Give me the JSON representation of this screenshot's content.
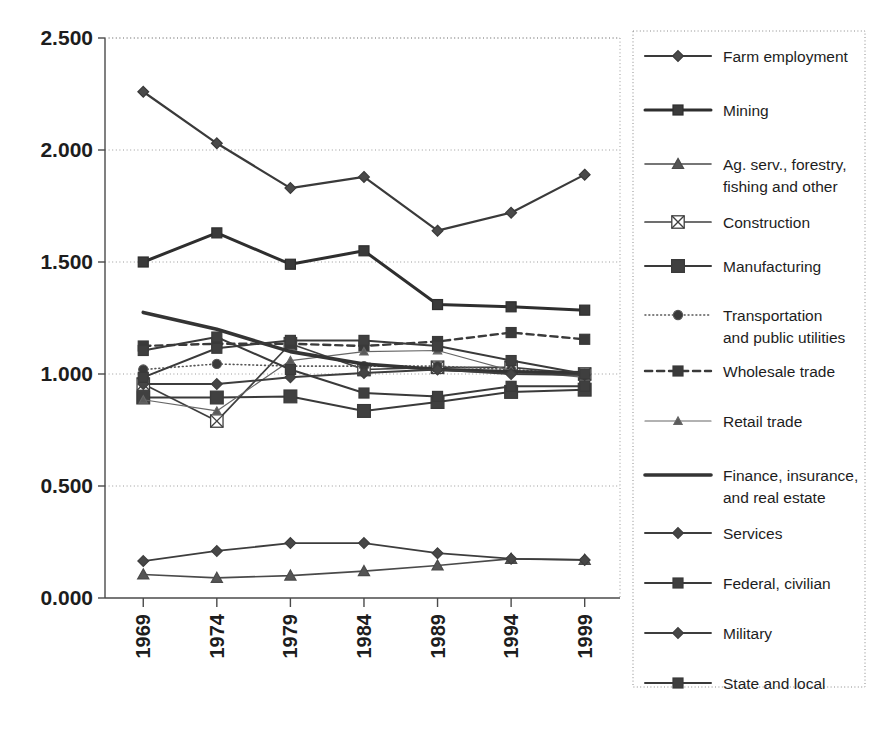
{
  "chart_data": {
    "type": "line",
    "title": "",
    "subtitle": "",
    "xlabel": "",
    "ylabel": "",
    "x": [
      1969,
      1974,
      1979,
      1984,
      1989,
      1994,
      1999
    ],
    "xtick_labels": [
      "1969",
      "1974",
      "1979",
      "1984",
      "1989",
      "1994",
      "1999"
    ],
    "ytick_labels": [
      "0.000",
      "0.500",
      "1.000",
      "1.500",
      "2.000",
      "2.500"
    ],
    "ytick_values": [
      0.0,
      0.5,
      1.0,
      1.5,
      2.0,
      2.5
    ],
    "ylim": [
      0.0,
      2.5
    ],
    "grid": "horizontal-dotted",
    "legend_position": "right",
    "series": [
      {
        "name": "Farm employment",
        "marker": "diamond",
        "line": "solid",
        "width": 2.2,
        "color": "#3a3a3a",
        "fill": "#4a4a4a",
        "values": [
          2.26,
          2.03,
          1.83,
          1.88,
          1.64,
          1.72,
          1.89
        ]
      },
      {
        "name": "Mining",
        "marker": "square",
        "line": "solid",
        "width": 3.0,
        "color": "#2e2e2e",
        "fill": "#3a3a3a",
        "values": [
          1.5,
          1.63,
          1.49,
          1.55,
          1.31,
          1.3,
          1.285
        ]
      },
      {
        "name": "Ag. serv., forestry, fishing and other",
        "marker": "triangle",
        "line": "solid",
        "width": 1.6,
        "color": "#4a4a4a",
        "fill": "#555555",
        "values": [
          0.105,
          0.09,
          0.1,
          0.12,
          0.145,
          0.175,
          0.17
        ]
      },
      {
        "name": "Construction",
        "marker": "x-box",
        "line": "solid",
        "width": 1.7,
        "color": "#3f3f3f",
        "fill": "#ffffff",
        "values": [
          0.955,
          0.79,
          1.135,
          1.02,
          1.03,
          1.03,
          1.0
        ]
      },
      {
        "name": "Manufacturing",
        "marker": "square-lg",
        "line": "solid",
        "width": 2.0,
        "color": "#3a3a3a",
        "fill": "#404040",
        "values": [
          0.895,
          0.895,
          0.9,
          0.835,
          0.875,
          0.92,
          0.93
        ]
      },
      {
        "name": "Transportation and public utilities",
        "marker": "circle",
        "line": "dotted",
        "width": 1.6,
        "color": "#555555",
        "fill": "#3a3a3a",
        "values": [
          1.02,
          1.045,
          1.035,
          1.035,
          1.035,
          1.02,
          1.0
        ]
      },
      {
        "name": "Wholesale trade",
        "marker": "square",
        "line": "dashed",
        "width": 2.4,
        "color": "#3a3a3a",
        "fill": "#3a3a3a",
        "values": [
          1.125,
          1.135,
          1.135,
          1.125,
          1.145,
          1.185,
          1.155
        ]
      },
      {
        "name": "Retail trade",
        "marker": "triangle-sm",
        "line": "solid",
        "width": 1.2,
        "color": "#666666",
        "fill": "#5a5a5a",
        "values": [
          0.885,
          0.835,
          1.06,
          1.1,
          1.105,
          1.015,
          0.985
        ]
      },
      {
        "name": "Finance, insurance, and real estate",
        "marker": "none",
        "line": "solid",
        "width": 3.6,
        "color": "#343434",
        "fill": "#343434",
        "values": [
          1.275,
          1.2,
          1.1,
          1.045,
          1.02,
          1.01,
          1.005
        ]
      },
      {
        "name": "Services",
        "marker": "diamond",
        "line": "solid",
        "width": 2.0,
        "color": "#3d3d3d",
        "fill": "#454545",
        "values": [
          0.955,
          0.955,
          0.985,
          1.005,
          1.02,
          1.0,
          0.995
        ]
      },
      {
        "name": "Federal, civilian",
        "marker": "square",
        "line": "solid",
        "width": 2.0,
        "color": "#3a3a3a",
        "fill": "#3f3f3f",
        "values": [
          1.105,
          1.165,
          1.02,
          0.915,
          0.9,
          0.945,
          0.945
        ]
      },
      {
        "name": "Military",
        "marker": "diamond",
        "line": "solid",
        "width": 1.8,
        "color": "#3d3d3d",
        "fill": "#474747",
        "values": [
          0.165,
          0.21,
          0.245,
          0.245,
          0.2,
          0.175,
          0.17
        ]
      },
      {
        "name": "State and local",
        "marker": "square",
        "line": "solid",
        "width": 2.0,
        "color": "#3a3a3a",
        "fill": "#3f3f3f",
        "values": [
          0.985,
          1.115,
          1.15,
          1.15,
          1.125,
          1.06,
          1.0
        ]
      }
    ]
  },
  "legend": {
    "items": [
      {
        "label": "Farm employment",
        "lines": [
          "Farm employment"
        ]
      },
      {
        "label": "Mining",
        "lines": [
          "Mining"
        ]
      },
      {
        "label": "Ag. serv., forestry, fishing and other",
        "lines": [
          "Ag. serv., forestry,",
          "fishing and other"
        ]
      },
      {
        "label": "Construction",
        "lines": [
          "Construction"
        ]
      },
      {
        "label": "Manufacturing",
        "lines": [
          "Manufacturing"
        ]
      },
      {
        "label": "Transportation and public utilities",
        "lines": [
          "Transportation",
          "and public utilities"
        ]
      },
      {
        "label": "Wholesale trade",
        "lines": [
          "Wholesale trade"
        ]
      },
      {
        "label": "Retail trade",
        "lines": [
          "Retail trade"
        ]
      },
      {
        "label": "Finance, insurance, and real estate",
        "lines": [
          "Finance, insurance,",
          "and real estate"
        ]
      },
      {
        "label": "Services",
        "lines": [
          "Services"
        ]
      },
      {
        "label": "Federal, civilian",
        "lines": [
          "Federal, civilian"
        ]
      },
      {
        "label": "Military",
        "lines": [
          "Military"
        ]
      },
      {
        "label": "State and local",
        "lines": [
          "State and local"
        ]
      }
    ]
  },
  "colors": {
    "axis": "#4a4a4a",
    "grid": "#9a9a9a",
    "text": "#1d1d1d",
    "legend_border": "#8a8a8a",
    "background": "#ffffff"
  }
}
